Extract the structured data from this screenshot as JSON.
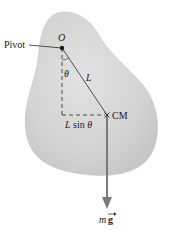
{
  "diagram": {
    "labels": {
      "pivot": "Pivot",
      "origin": "O",
      "angle": "θ",
      "length": "L",
      "lever_arm_L": "L",
      "lever_arm_rest": " sin ",
      "lever_arm_theta": "θ",
      "cm": "CM",
      "weight_m": "m",
      "weight_g": "g"
    },
    "colors": {
      "body_fill": "#d6d6d6",
      "body_edge": "#c4c4c4",
      "line": "#2a2a2a",
      "arrow": "#7a7a7a",
      "text": "#1a1a1a"
    },
    "points": {
      "pivot": [
        62,
        48
      ],
      "cm": [
        107,
        115
      ],
      "arrow_tip": [
        107,
        208
      ]
    }
  }
}
